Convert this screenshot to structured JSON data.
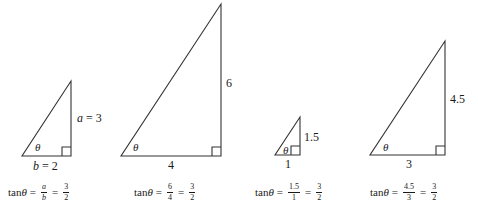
{
  "figure": {
    "angle_symbol": "θ",
    "stroke_color": "#333333"
  },
  "triangles": [
    {
      "opposite_label_var": "a",
      "opposite_label_eq": " = 3",
      "adjacent_label_var": "b",
      "adjacent_label_eq": " = 2",
      "formula": {
        "lhs": "tan ",
        "theta": "θ",
        "eq1": "=",
        "frac1_num": "a",
        "frac1_den": "b",
        "eq2": "=",
        "frac2_num": "3",
        "frac2_den": "2"
      }
    },
    {
      "opposite_label": "6",
      "adjacent_label": "4",
      "formula": {
        "lhs": "tan ",
        "theta": "θ",
        "eq1": "=",
        "frac1_num": "6",
        "frac1_den": "4",
        "eq2": "=",
        "frac2_num": "3",
        "frac2_den": "2"
      }
    },
    {
      "opposite_label": "1.5",
      "adjacent_label": "1",
      "formula": {
        "lhs": "tan ",
        "theta": "θ",
        "eq1": "=",
        "frac1_num": "1.5",
        "frac1_den": "1",
        "eq2": "=",
        "frac2_num": "3",
        "frac2_den": "2"
      }
    },
    {
      "opposite_label": "4.5",
      "adjacent_label": "3",
      "formula": {
        "lhs": "tan ",
        "theta": "θ",
        "eq1": "=",
        "frac1_num": "4.5",
        "frac1_den": "3",
        "eq2": "=",
        "frac2_num": "3",
        "frac2_den": "2"
      }
    }
  ]
}
